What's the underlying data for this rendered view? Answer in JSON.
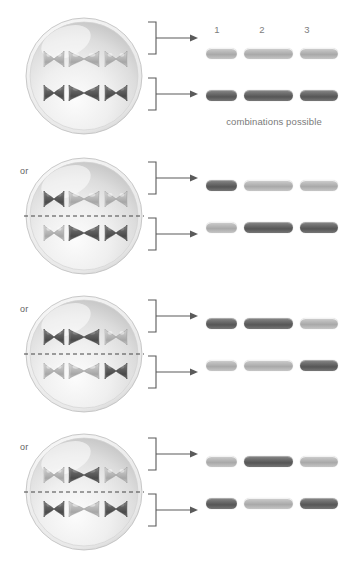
{
  "figure": {
    "title_visible": false,
    "caption": "combinations possible",
    "or_label": "or",
    "column_headers": [
      "1",
      "2",
      "3"
    ],
    "colors": {
      "band_light": "#bdbdbd",
      "band_dark": "#6f6f6f",
      "chromosome_light": "#b5b5b5",
      "chromosome_dark": "#5e5e5e",
      "cell_membrane": "#c9c9c9",
      "text": "#7a7a7a",
      "background": "#ffffff"
    }
  },
  "panels": [
    {
      "index": 0,
      "or_label": "",
      "show_or": false,
      "show_equator": false,
      "cell": {
        "top_row": [
          "light",
          "light",
          "light"
        ],
        "bottom_row": [
          "dark",
          "dark",
          "dark"
        ]
      },
      "show_headers": true,
      "show_caption": true,
      "gametes": {
        "top": [
          "light",
          "light",
          "light"
        ],
        "bottom": [
          "dark",
          "dark",
          "dark"
        ]
      }
    },
    {
      "index": 1,
      "or_label": "or",
      "show_or": true,
      "show_equator": true,
      "cell": {
        "top_row": [
          "dark",
          "light",
          "light"
        ],
        "bottom_row": [
          "light",
          "dark",
          "dark"
        ]
      },
      "show_headers": false,
      "show_caption": false,
      "gametes": {
        "top": [
          "dark",
          "light",
          "light"
        ],
        "bottom": [
          "light",
          "dark",
          "dark"
        ]
      }
    },
    {
      "index": 2,
      "or_label": "or",
      "show_or": true,
      "show_equator": true,
      "cell": {
        "top_row": [
          "dark",
          "dark",
          "light"
        ],
        "bottom_row": [
          "light",
          "light",
          "dark"
        ]
      },
      "show_headers": false,
      "show_caption": false,
      "gametes": {
        "top": [
          "dark",
          "dark",
          "light"
        ],
        "bottom": [
          "light",
          "light",
          "dark"
        ]
      }
    },
    {
      "index": 3,
      "or_label": "or",
      "show_or": true,
      "show_equator": true,
      "cell": {
        "top_row": [
          "light",
          "dark",
          "light"
        ],
        "bottom_row": [
          "dark",
          "light",
          "dark"
        ]
      },
      "show_headers": false,
      "show_caption": false,
      "gametes": {
        "top": [
          "light",
          "dark",
          "light"
        ],
        "bottom": [
          "dark",
          "light",
          "dark"
        ]
      }
    }
  ]
}
